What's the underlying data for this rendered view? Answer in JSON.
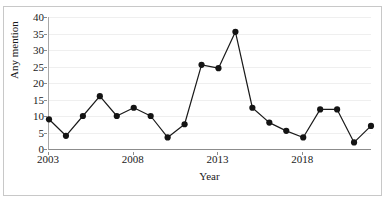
{
  "figure": {
    "width": 387,
    "height": 201,
    "background": "#ffffff",
    "frame_color": "#c8c8c8"
  },
  "chart_data": {
    "type": "line",
    "title": "",
    "xlabel": "Year",
    "ylabel": "Any mention",
    "x": [
      2003,
      2004,
      2005,
      2006,
      2007,
      2008,
      2009,
      2010,
      2011,
      2012,
      2013,
      2014,
      2015,
      2016,
      2017,
      2018,
      2019,
      2020,
      2021,
      2022
    ],
    "values": [
      9,
      4,
      10,
      16,
      10,
      12.5,
      10,
      3.5,
      7.5,
      25.5,
      24.5,
      35.5,
      12.5,
      8,
      5.5,
      3.5,
      12,
      12,
      2,
      7
    ],
    "series": [
      {
        "name": "Any mention",
        "values": [
          9,
          4,
          10,
          16,
          10,
          12.5,
          10,
          3.5,
          7.5,
          25.5,
          24.5,
          35.5,
          12.5,
          8,
          5.5,
          3.5,
          12,
          12,
          2,
          7
        ]
      }
    ],
    "xlim": [
      2003,
      2022
    ],
    "ylim": [
      0,
      40
    ],
    "ytick_labels": [
      "0",
      "5",
      "10",
      "15",
      "20",
      "25",
      "30",
      "35",
      "40"
    ],
    "ytick_values": [
      0,
      5,
      10,
      15,
      20,
      25,
      30,
      35,
      40
    ],
    "xtick_labels": [
      "2003",
      "2008",
      "2013",
      "2018"
    ],
    "xtick_values": [
      2003,
      2008,
      2013,
      2018
    ],
    "grid": true,
    "grid_axis": "y",
    "grid_color": "#efefef",
    "legend": false,
    "legend_position": "none",
    "line_color": "#1a1a1a",
    "line_width": 1.2,
    "marker": "circle",
    "marker_size": 3.1,
    "marker_color": "#141414"
  }
}
